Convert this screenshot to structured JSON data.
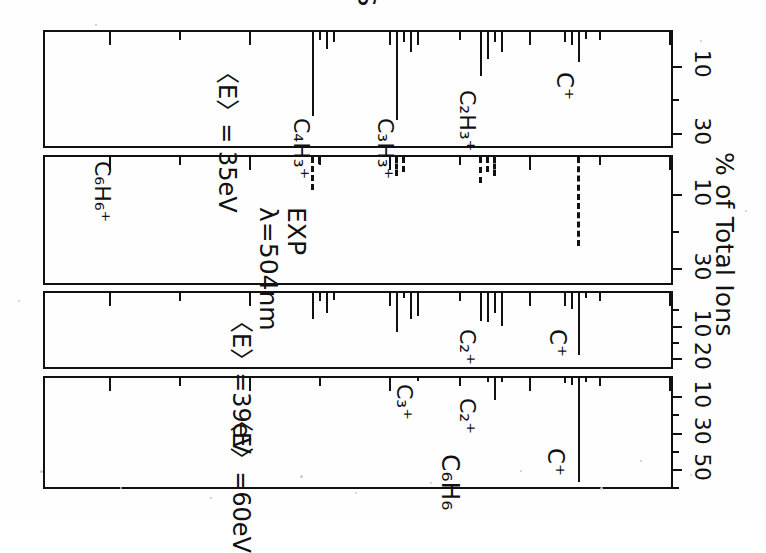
{
  "figure": {
    "y_axis_title": "% of Total Ions",
    "x_axis_title": "MASS"
  },
  "mass_axis": {
    "ticks_major": [
      0,
      20,
      40,
      60,
      80
    ],
    "ticks_minor": [
      10,
      30,
      50,
      70
    ],
    "min": 0,
    "max": 90,
    "labels": [
      "0",
      "20",
      "40",
      "60",
      "80"
    ]
  },
  "chart_data": [
    {
      "type": "bar",
      "panel_id": "panel-35ev",
      "title": "<E>=35eV",
      "xlabel": "MASS",
      "ylabel": "% of Total Ions",
      "xlim": [
        0,
        90
      ],
      "ylim": [
        0,
        35
      ],
      "yticks_major": [
        10,
        30
      ],
      "yticks_minor": [
        20
      ],
      "ytick_labels": [
        "10",
        "30"
      ],
      "grid": false,
      "line_style": "solid",
      "annotations": [
        {
          "text": "C+",
          "mass": 13.5
        },
        {
          "text": "C2H3+",
          "mass": 28.5
        },
        {
          "text": "C3H3+",
          "mass": 41.0
        },
        {
          "text": "C4H3+",
          "mass": 52.5
        },
        {
          "text": "<E>=35eV",
          "mass": 64.0
        }
      ],
      "x": [
        12,
        13,
        14,
        15,
        24,
        25,
        26,
        27,
        36,
        37,
        38,
        39,
        48,
        49,
        50,
        51
      ],
      "values": [
        2.0,
        9.0,
        4.0,
        3.0,
        6.0,
        3.0,
        8.0,
        13.0,
        4.0,
        6.0,
        3.0,
        26.0,
        3.0,
        5.0,
        2.0,
        25.0
      ]
    },
    {
      "type": "bar",
      "panel_id": "panel-exp",
      "title": "EXP",
      "subtitle": "λ=504nm",
      "xlabel": "MASS",
      "ylabel": "% of Total Ions",
      "xlim": [
        0,
        90
      ],
      "ylim": [
        0,
        35
      ],
      "yticks_major": [
        10,
        30
      ],
      "yticks_minor": [
        20
      ],
      "ytick_labels": [
        "10",
        "30"
      ],
      "grid": false,
      "line_style": "dashed",
      "annotations": [
        {
          "text": "EXP",
          "mass": 55.0
        },
        {
          "text": "λ=504nm",
          "mass": 62.0
        },
        {
          "text": "C6H6+",
          "mass": 78.0
        }
      ],
      "x": [
        13,
        25,
        26,
        27,
        38,
        39,
        50,
        51
      ],
      "values": [
        24.0,
        5.0,
        4.0,
        7.0,
        4.0,
        5.0,
        2.0,
        9.0
      ]
    },
    {
      "type": "bar",
      "panel_id": "panel-39ev",
      "title": "<E>=39eV",
      "xlabel": "MASS",
      "ylabel": "% of Total Ions",
      "xlim": [
        0,
        90
      ],
      "ylim": [
        0,
        24
      ],
      "yticks_major": [
        10,
        20
      ],
      "yticks_minor": [
        5,
        15
      ],
      "ytick_labels": [
        "10",
        "20"
      ],
      "grid": false,
      "line_style": "solid",
      "annotations": [
        {
          "text": "C+",
          "mass": 14.5
        },
        {
          "text": "C2+",
          "mass": 28.0
        },
        {
          "text": "<E>=39eV",
          "mass": 62.0
        }
      ],
      "x": [
        12,
        13,
        14,
        15,
        24,
        25,
        26,
        27,
        36,
        37,
        38,
        39,
        48,
        49,
        50,
        51
      ],
      "values": [
        1.5,
        19.0,
        5.0,
        4.0,
        10.0,
        6.0,
        9.0,
        8.5,
        7.0,
        8.0,
        1.5,
        12.0,
        2.0,
        6.0,
        1.5,
        8.0
      ]
    },
    {
      "type": "bar",
      "panel_id": "panel-60ev",
      "title": "<E>=60eV",
      "xlabel": "MASS",
      "ylabel": "% of Total Ions",
      "xlim": [
        0,
        90
      ],
      "ylim": [
        0,
        62
      ],
      "yticks_major": [
        10,
        30,
        50
      ],
      "yticks_minor": [
        20,
        40,
        60
      ],
      "ytick_labels": [
        "10",
        "30",
        "50"
      ],
      "grid": false,
      "line_style": "solid",
      "annotations": [
        {
          "text": "C+",
          "mass": 17.0
        },
        {
          "text": "C2+",
          "mass": 28.5
        },
        {
          "text": "C3+",
          "mass": 37.5
        },
        {
          "text": "C6H6",
          "mass": 30.0
        },
        {
          "text": "<E>=60eV",
          "mass": 62.0
        }
      ],
      "x": [
        12,
        13,
        14,
        15,
        24,
        25,
        26,
        36
      ],
      "values": [
        2.0,
        57.0,
        4.0,
        2.5,
        2.0,
        12.0,
        2.0,
        1.5
      ]
    }
  ],
  "labels": {
    "panel35": {
      "c_plus": "C⁺",
      "c2h3": "C₂H₃⁺",
      "c3h3": "C₃H₃⁺",
      "c4h3": "C₄H₃⁺",
      "energy": "〈E〉= 35eV"
    },
    "panelexp": {
      "exp": "EXP",
      "lambda": "λ=504nm",
      "c6h6": "C₆H₆⁺"
    },
    "panel39": {
      "c_plus": "C⁺",
      "c2": "C₂⁺",
      "energy": "〈E〉=39eV"
    },
    "panel60": {
      "c_plus": "C⁺",
      "c2": "C₂⁺",
      "c3": "C₃⁺",
      "c6h6": "C₆H₆",
      "energy": "〈E〉=60eV"
    }
  },
  "ytick_labels": {
    "p35": [
      "10",
      "30"
    ],
    "pexp": [
      "10",
      "30"
    ],
    "p39": [
      "10",
      "20"
    ],
    "p60": [
      "10",
      "30",
      "50"
    ]
  },
  "colors": {
    "ink": "#111111",
    "paper": "#fefefe"
  }
}
